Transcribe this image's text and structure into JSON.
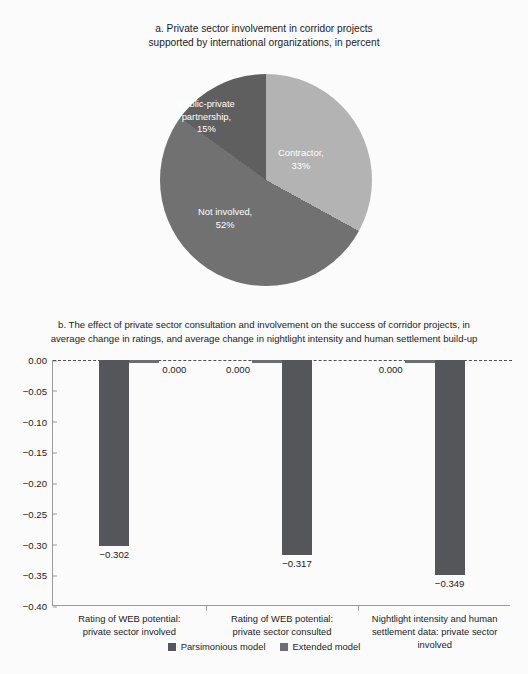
{
  "figure": {
    "background": "#fbfbfb"
  },
  "panel_a": {
    "title_line1": "a. Private sector involvement in corridor projects",
    "title_line2": "supported by international organizations, in percent",
    "labels": {
      "contractor_l1": "Contractor,",
      "contractor_l2": "33%",
      "ppp_l1": "Public-private",
      "ppp_l2": "partnership,",
      "ppp_l3": "15%",
      "not_involved_l1": "Not involved,",
      "not_involved_l2": "52%"
    }
  },
  "panel_b": {
    "subtitle_line1": "b. The effect of private sector consultation and involvement on the success of corridor projects, in",
    "subtitle_line2": "average change in ratings, and average change in nightlight intensity and human settlement build-up",
    "legend": {
      "parsimonious": "Parsimonious model",
      "extended": "Extended model"
    }
  },
  "chart_data": [
    {
      "type": "pie",
      "title": "a. Private sector involvement in corridor projects supported by international organizations, in percent",
      "labels": [
        "Contractor",
        "Not involved",
        "Public-private partnership"
      ],
      "values": [
        33,
        52,
        15
      ],
      "unit": "percent",
      "colors": [
        "#b3b3b3",
        "#717171",
        "#5f5f5f"
      ],
      "legend": "none",
      "data_labels": [
        "Contractor, 33%",
        "Not involved, 52%",
        "Public-private partnership, 15%"
      ]
    },
    {
      "type": "bar",
      "title": "b. The effect of private sector consultation and involvement on the success of corridor projects, in average change in ratings, and average change in nightlight intensity and human settlement build-up",
      "categories": [
        "Rating of WEB potential: private sector involved",
        "Rating of WEB potential: private sector consulted",
        "Nightlight intensity and human settlement data: private sector involved"
      ],
      "category_lines": [
        [
          "Rating of WEB potential:",
          "private sector involved"
        ],
        [
          "Rating of WEB potential:",
          "private sector consulted"
        ],
        [
          "Nightlight intensity and human",
          "settlement data: private sector involved"
        ]
      ],
      "series": [
        {
          "name": "Parsimonious model",
          "color": "#555659",
          "values": [
            -0.302,
            -0.317,
            -0.349
          ],
          "labels": [
            "−0.302",
            "−0.317",
            "−0.349"
          ]
        },
        {
          "name": "Extended model",
          "color": "#6d6e71",
          "values": [
            0.0,
            0.0,
            0.0
          ],
          "labels": [
            "0.000",
            "0.000",
            "0.000"
          ]
        }
      ],
      "xlabel": "",
      "ylabel": "",
      "ylim": [
        -0.4,
        0.0
      ],
      "yticks": [
        0.0,
        -0.05,
        -0.1,
        -0.15,
        -0.2,
        -0.25,
        -0.3,
        -0.35,
        -0.4
      ],
      "ytick_labels": [
        "0.00",
        "−0.05",
        "−0.10",
        "−0.15",
        "−0.20",
        "−0.25",
        "−0.30",
        "−0.35",
        "−0.40"
      ],
      "grid": false,
      "zero_reference_line": true,
      "legend_position": "bottom"
    }
  ]
}
